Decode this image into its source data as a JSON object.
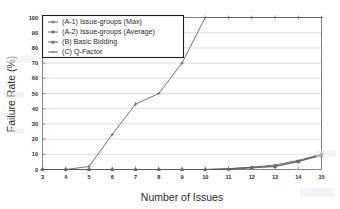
{
  "chart_data": {
    "type": "line",
    "title": "",
    "xlabel": "Number of Issues",
    "ylabel": "Failure Rate (%)",
    "xlim": [
      3,
      15
    ],
    "ylim": [
      0,
      100
    ],
    "xticks": [
      3,
      4,
      5,
      6,
      7,
      8,
      9,
      10,
      11,
      12,
      13,
      14,
      15
    ],
    "yticks": [
      0,
      10,
      20,
      30,
      40,
      50,
      60,
      70,
      80,
      90,
      100
    ],
    "xtick_labels": [
      "3",
      "4",
      "5",
      "6",
      "7",
      "8",
      "9",
      "10",
      "11",
      "12",
      "13",
      "14",
      "15"
    ],
    "ytick_labels": [
      "0",
      "10",
      "20",
      "30",
      "40",
      "50",
      "60",
      "70",
      "80",
      "90",
      "100"
    ],
    "grid": "horizontal",
    "legend_position": "upper-left",
    "x": [
      3,
      4,
      5,
      6,
      7,
      8,
      9,
      10,
      11,
      12,
      13,
      14,
      15
    ],
    "series": [
      {
        "name": "(A-1) Issue-groups (Max)",
        "marker": "cross",
        "color": "#5a5a5a",
        "values": [
          0,
          0,
          2,
          23,
          43,
          50,
          70,
          100,
          100,
          100,
          100,
          100,
          100
        ]
      },
      {
        "name": "(A-2) Issue-groups (Average)",
        "marker": "asterisk",
        "color": "#5a5a5a",
        "values": [
          0,
          0,
          0,
          0,
          0,
          0,
          0,
          0,
          0,
          1,
          2,
          5,
          10
        ]
      },
      {
        "name": "(B) Basic Bidding",
        "marker": "triangle",
        "color": "#5a5a5a",
        "values": [
          0,
          0,
          0,
          0,
          0,
          0,
          0,
          0,
          0.5,
          1.5,
          2,
          5.5,
          9
        ]
      },
      {
        "name": "(C) Q-Factor",
        "marker": "line",
        "color": "#5a5a5a",
        "values": [
          0,
          0,
          0,
          0,
          0,
          0,
          0,
          0,
          0.5,
          1.5,
          3,
          6,
          10
        ]
      }
    ]
  },
  "axes": {
    "ylabel": "Failure Rate (%)",
    "xlabel": "Number of Issues"
  },
  "legend": {
    "items": [
      {
        "label": "(A-1) Issue-groups (Max)"
      },
      {
        "label": "(A-2) Issue-groups (Average)"
      },
      {
        "label": "(B) Basic Bidding"
      },
      {
        "label": "(C) Q-Factor"
      }
    ]
  },
  "colors": {
    "line": "#5a5a5a",
    "grid": "#c9c9c9",
    "frame": "#7a7a7a",
    "text": "#2b2b2b",
    "background": "#ffffff"
  }
}
